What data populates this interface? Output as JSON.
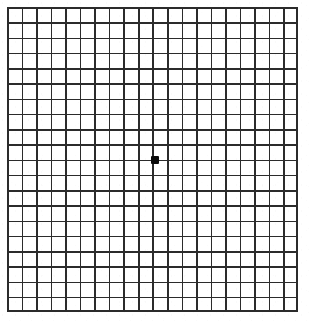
{
  "chart_data": {
    "type": "table",
    "subtitle": "",
    "xlabel": "",
    "ylabel": "",
    "grid": true,
    "legend": null,
    "columns": 20,
    "rows": 20,
    "cell_size_px": 14.45,
    "grid_left_px": 7,
    "grid_top_px": 7,
    "grid_width_px": 291,
    "grid_height_px": 305,
    "line_color": "#2b2b2b",
    "line_width_px": 1.6,
    "border_width_px": 2,
    "background_color": "#ffffff",
    "fixation_dot": {
      "label": "central fixation dot",
      "shape": "square",
      "color": "#0a0a0a",
      "size_px": 8,
      "center_x_px": 155,
      "center_y_px": 160,
      "grid_column": 10,
      "grid_row": 10
    }
  },
  "chart": {
    "name": "amsler-grid",
    "dot_label": "central fixation dot"
  }
}
